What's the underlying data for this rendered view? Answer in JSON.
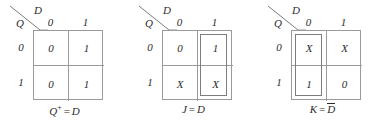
{
  "figure": {
    "type": "karnaugh-maps",
    "count": 3,
    "background": "#ffffff",
    "grid_color": "#9a9a9a",
    "group_color": "#7d7d7d",
    "text_color": "#2b2b2b"
  },
  "maps": [
    {
      "id": "kmap-q-next",
      "corner": {
        "top_var": "D",
        "side_var": "Q"
      },
      "col_headers": [
        "0",
        "1"
      ],
      "row_headers": [
        "0",
        "1"
      ],
      "cells": [
        [
          "0",
          "1"
        ],
        [
          "0",
          "1"
        ]
      ],
      "groups": [],
      "caption": {
        "lhs": "Q",
        "lhs_sup": "+",
        "eq": "=",
        "rhs": "D",
        "rhs_overbar": false
      }
    },
    {
      "id": "kmap-j",
      "corner": {
        "top_var": "D",
        "side_var": "Q"
      },
      "col_headers": [
        "0",
        "1"
      ],
      "row_headers": [
        "0",
        "1"
      ],
      "cells": [
        [
          "0",
          "1"
        ],
        [
          "X",
          "X"
        ]
      ],
      "groups": [
        "col-right"
      ],
      "caption": {
        "lhs": "J",
        "lhs_sup": "",
        "eq": "=",
        "rhs": "D",
        "rhs_overbar": false
      }
    },
    {
      "id": "kmap-k",
      "corner": {
        "top_var": "D",
        "side_var": "Q"
      },
      "col_headers": [
        "0",
        "1"
      ],
      "row_headers": [
        "0",
        "1"
      ],
      "cells": [
        [
          "X",
          "X"
        ],
        [
          "1",
          "0"
        ]
      ],
      "groups": [
        "col-left"
      ],
      "caption": {
        "lhs": "K",
        "lhs_sup": "",
        "eq": "=",
        "rhs": "D",
        "rhs_overbar": true
      }
    }
  ]
}
